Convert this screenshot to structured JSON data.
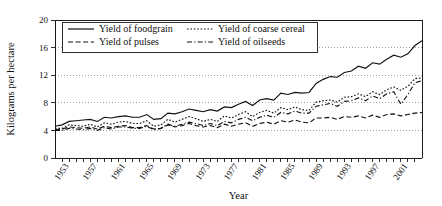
{
  "chart_data": {
    "type": "line",
    "title": "",
    "xlabel": "Year",
    "ylabel": "Kilograms per hectare",
    "xlim": [
      1951,
      2003
    ],
    "ylim": [
      0,
      20
    ],
    "yticks": [
      0,
      4,
      8,
      12,
      16,
      20
    ],
    "ytick_labels": [
      "0",
      "4",
      "8",
      "12",
      "16",
      "20"
    ],
    "xticks": [
      1953,
      1957,
      1961,
      1965,
      1969,
      1973,
      1977,
      1981,
      1985,
      1989,
      1993,
      1997,
      2001
    ],
    "xtick_labels": [
      "1953",
      "1957",
      "1961",
      "1965",
      "1969",
      "1973",
      "1977",
      "1981",
      "1985",
      "1989",
      "1993",
      "1997",
      "2001"
    ],
    "grid": true,
    "grid_axis": "y",
    "legend_position": "top-inside",
    "x": [
      1951,
      1952,
      1953,
      1954,
      1955,
      1956,
      1957,
      1958,
      1959,
      1960,
      1961,
      1962,
      1963,
      1964,
      1965,
      1966,
      1967,
      1968,
      1969,
      1970,
      1971,
      1972,
      1973,
      1974,
      1975,
      1976,
      1977,
      1978,
      1979,
      1980,
      1981,
      1982,
      1983,
      1984,
      1985,
      1986,
      1987,
      1988,
      1989,
      1990,
      1991,
      1992,
      1993,
      1994,
      1995,
      1996,
      1997,
      1998,
      1999,
      2000,
      2001,
      2002
    ],
    "series": [
      {
        "name": "Yield of foodgrain",
        "style": "solid",
        "values": [
          4.6,
          4.8,
          5.3,
          5.4,
          5.5,
          5.6,
          5.3,
          5.9,
          5.8,
          6.0,
          6.1,
          5.9,
          5.9,
          6.3,
          5.6,
          5.7,
          6.5,
          6.4,
          6.7,
          7.1,
          6.9,
          6.7,
          7.0,
          6.8,
          7.4,
          7.3,
          7.8,
          8.2,
          7.6,
          8.4,
          8.6,
          8.4,
          9.4,
          9.2,
          9.5,
          9.4,
          9.5,
          10.8,
          11.4,
          11.8,
          11.7,
          12.4,
          12.6,
          13.3,
          13.0,
          13.8,
          13.6,
          14.3,
          14.9,
          14.6,
          15.1,
          16.3
        ],
        "end_value": 17.0
      },
      {
        "name": "Yield of coarse cereal",
        "style": "dotted",
        "values": [
          4.3,
          4.3,
          4.8,
          4.7,
          4.6,
          4.9,
          4.5,
          5.1,
          4.9,
          5.2,
          5.3,
          5.0,
          5.0,
          5.4,
          4.6,
          4.8,
          5.6,
          5.2,
          5.6,
          6.0,
          5.7,
          5.3,
          5.6,
          5.3,
          6.1,
          5.8,
          6.3,
          6.7,
          6.0,
          6.6,
          6.9,
          6.5,
          7.3,
          7.0,
          7.4,
          7.0,
          6.9,
          8.1,
          8.3,
          8.4,
          8.1,
          8.8,
          8.9,
          9.3,
          8.9,
          9.6,
          9.2,
          9.9,
          10.3,
          9.8,
          10.4,
          11.5
        ],
        "end_value": 11.6
      },
      {
        "name": "Yield of pulses",
        "style": "dashed",
        "values": [
          4.1,
          4.2,
          4.5,
          4.4,
          4.3,
          4.5,
          4.2,
          4.6,
          4.4,
          4.6,
          4.7,
          4.4,
          4.4,
          4.7,
          4.2,
          4.3,
          4.8,
          4.5,
          4.7,
          5.0,
          4.7,
          4.5,
          4.7,
          4.4,
          4.9,
          4.6,
          4.9,
          5.1,
          4.6,
          5.0,
          5.2,
          4.9,
          5.4,
          5.2,
          5.5,
          5.2,
          5.1,
          5.8,
          5.8,
          5.9,
          5.6,
          6.0,
          5.9,
          6.1,
          5.8,
          6.2,
          5.9,
          6.3,
          6.4,
          6.1,
          6.3,
          6.5
        ],
        "end_value": 6.6
      },
      {
        "name": "Yield of oilseeds",
        "style": "dashdot",
        "values": [
          4.0,
          4.0,
          4.3,
          4.2,
          4.1,
          4.3,
          4.0,
          4.4,
          4.2,
          4.5,
          4.5,
          4.3,
          4.3,
          4.6,
          4.1,
          4.3,
          4.9,
          4.6,
          4.9,
          5.2,
          5.0,
          4.7,
          5.0,
          4.7,
          5.3,
          5.1,
          5.6,
          5.9,
          5.4,
          5.9,
          6.2,
          5.9,
          6.6,
          6.4,
          6.8,
          6.5,
          6.5,
          7.5,
          7.7,
          7.9,
          7.5,
          8.2,
          8.3,
          8.7,
          8.3,
          9.0,
          8.6,
          9.3,
          9.6,
          7.8,
          9.2,
          10.9
        ],
        "end_value": 11.2
      }
    ]
  },
  "legend": {
    "entries": [
      {
        "label": "Yield of foodgrain",
        "style": "solid"
      },
      {
        "label": "Yield of coarse cereal",
        "style": "dotted"
      },
      {
        "label": "Yield of pulses",
        "style": "dashed"
      },
      {
        "label": "Yield of oilseeds",
        "style": "dashdot"
      }
    ]
  }
}
